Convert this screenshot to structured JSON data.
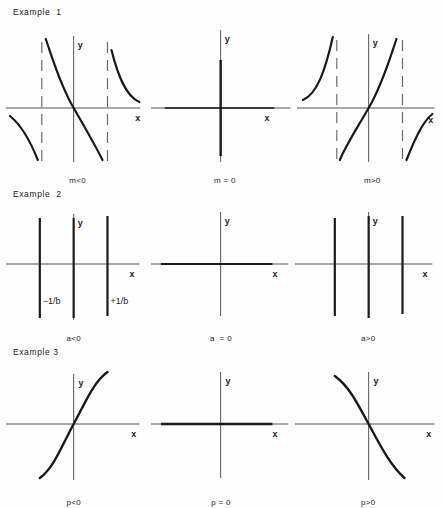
{
  "figure": {
    "page_width": 442,
    "page_height": 508,
    "background_color": "#fefefe",
    "curve_color": "#1a1a1a",
    "axis_color": "#55555a",
    "asymptote_color": "#6a6a6a",
    "axis_label_x": "x",
    "axis_label_y": "y"
  },
  "examples": [
    {
      "heading": "Example  1",
      "parameter": "m",
      "panels": [
        {
          "caption": "m<0",
          "kind": "tangent-decreasing",
          "has_asymptotes": true,
          "asymptote_count": 2,
          "label_left": "",
          "label_right": "",
          "axis_x": "x",
          "axis_y": "y"
        },
        {
          "caption": "m = 0",
          "kind": "degenerate-vertical",
          "has_asymptotes": false,
          "asymptote_count": 0,
          "label_left": "",
          "label_right": "",
          "axis_x": "x",
          "axis_y": "y"
        },
        {
          "caption": "m>0",
          "kind": "tangent-increasing",
          "has_asymptotes": true,
          "asymptote_count": 2,
          "label_left": "",
          "label_right": "",
          "axis_x": "x",
          "axis_y": "y"
        }
      ]
    },
    {
      "heading": "Example  2",
      "parameter": "a",
      "panels": [
        {
          "caption": "a<0",
          "kind": "three-vertical-lines",
          "has_asymptotes": false,
          "asymptote_count": 0,
          "label_left": "−1/b",
          "label_right": "+1/b",
          "axis_x": "x",
          "axis_y": "y"
        },
        {
          "caption": "a  = 0",
          "kind": "degenerate-horizontal",
          "has_asymptotes": false,
          "asymptote_count": 0,
          "label_left": "",
          "label_right": "",
          "axis_x": "x",
          "axis_y": "y"
        },
        {
          "caption": "a>0",
          "kind": "three-vertical-lines",
          "has_asymptotes": false,
          "asymptote_count": 0,
          "label_left": "",
          "label_right": "",
          "axis_x": "x",
          "axis_y": "y"
        }
      ]
    },
    {
      "heading": "Example 3",
      "parameter": "p",
      "panels": [
        {
          "caption": "p<0",
          "kind": "s-curve-increasing",
          "has_asymptotes": false,
          "asymptote_count": 0,
          "label_left": "",
          "label_right": "",
          "axis_x": "x",
          "axis_y": "y"
        },
        {
          "caption": "p = 0",
          "kind": "degenerate-horizontal",
          "has_asymptotes": false,
          "asymptote_count": 0,
          "label_left": "",
          "label_right": "",
          "axis_x": "x",
          "axis_y": "y"
        },
        {
          "caption": "p>0",
          "kind": "s-curve-decreasing",
          "has_asymptotes": false,
          "asymptote_count": 0,
          "label_left": "",
          "label_right": "",
          "axis_x": "x",
          "axis_y": "y"
        }
      ]
    }
  ]
}
